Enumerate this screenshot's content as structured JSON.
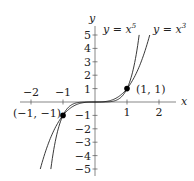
{
  "chart_data": {
    "type": "line",
    "title": "",
    "xlabel": "x",
    "ylabel": "y",
    "xlim": [
      -2.2,
      2.3
    ],
    "ylim": [
      -5.5,
      5.8
    ],
    "grid": false,
    "x_ticks": [
      -2,
      -1,
      1,
      2
    ],
    "x_tick_labels": [
      "−2",
      "−1",
      "1",
      "2"
    ],
    "y_ticks": [
      -5,
      -4,
      -3,
      -2,
      -1,
      1,
      2,
      3,
      4,
      5
    ],
    "y_tick_labels": [
      "−5",
      "−4",
      "−3",
      "−2",
      "−1",
      "1",
      "2",
      "3",
      "4",
      "5"
    ],
    "series": [
      {
        "name": "y = x^5",
        "label": "y = x⁵",
        "exponent": 5,
        "domain": [
          -1.38,
          1.38
        ]
      },
      {
        "name": "y = x^3",
        "label": "y = x³",
        "exponent": 3,
        "domain": [
          -1.71,
          1.71
        ]
      }
    ],
    "points": [
      {
        "x": -1,
        "y": -1,
        "label": "(−1, −1)"
      },
      {
        "x": 1,
        "y": 1,
        "label": "(1, 1)"
      }
    ],
    "legend": "inline labels at curve tops"
  },
  "labels": {
    "x_axis": "x",
    "y_axis": "y",
    "curve5": "y = x",
    "curve5_exp": "5",
    "curve3": "y = x",
    "curve3_exp": "3",
    "pt_pos": "(1, 1)",
    "pt_neg": "(−1, −1)"
  },
  "colors": {
    "curve": "#222222",
    "axis": "#555555",
    "point": "#000000"
  }
}
